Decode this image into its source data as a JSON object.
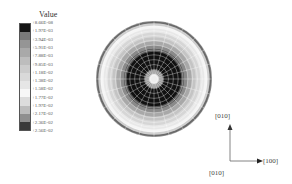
{
  "chart_data": {
    "type": "heatmap",
    "title": "",
    "subtitle": "Polar contour map (stereographic projection) of a scalar value on a sphere",
    "legend": {
      "title": "Value",
      "position": "left",
      "ticks": [
        "+8.66E-08",
        "+1.97E-03",
        "+3.94E-03",
        "+5.91E-03",
        "+7.88E-03",
        "+9.85E-03",
        "+1.18E-02",
        "+1.38E-02",
        "+1.58E-02",
        "+1.77E-02",
        "+1.97E-02",
        "+2.17E-02",
        "+2.36E-02",
        "+2.56E-02"
      ],
      "tick_values": [
        8.66e-08,
        0.00197,
        0.00394,
        0.00591,
        0.00788,
        0.00985,
        0.0118,
        0.0138,
        0.0158,
        0.0177,
        0.0197,
        0.0217,
        0.0236,
        0.0256
      ],
      "band_colors": [
        "#151515",
        "#7a7a7a",
        "#959595",
        "#a9a9a9",
        "#bdbdbd",
        "#cccccc",
        "#d9d9d9",
        "#e6e6e6",
        "#f7f7f7",
        "#dcdcdc",
        "#bcbcbc",
        "#8f8f8f",
        "#3a3a3a"
      ]
    },
    "range": [
      8.66e-08,
      0.0256
    ],
    "rings_from_center": [
      {
        "r": 0.08,
        "color": "#eeeeee"
      },
      {
        "r": 0.16,
        "color": "#9a9a9a"
      },
      {
        "r": 0.47,
        "color": "#111111"
      },
      {
        "r": 0.52,
        "color": "#555555"
      },
      {
        "r": 0.58,
        "color": "#8a8a8a"
      },
      {
        "r": 0.65,
        "color": "#a8a8a8"
      },
      {
        "r": 0.72,
        "color": "#c4c4c4"
      },
      {
        "r": 0.8,
        "color": "#d6d6d6"
      },
      {
        "r": 0.87,
        "color": "#e8e8e8"
      },
      {
        "r": 0.92,
        "color": "#f5f5f5"
      },
      {
        "r": 0.96,
        "color": "#cfcfcf"
      },
      {
        "r": 1.0,
        "color": "#6a6a6a"
      }
    ],
    "grid": {
      "radial_lines": 24,
      "circles": 12,
      "color": "#ffffff"
    },
    "axes": {
      "x_label": "[100]",
      "y_label": "[010]",
      "origin_label": "[010]"
    }
  },
  "legend": {
    "title": "Value"
  },
  "axes": {
    "up": "[010]",
    "right": "[100]",
    "origin": "[010]"
  }
}
